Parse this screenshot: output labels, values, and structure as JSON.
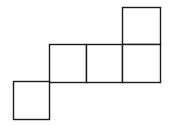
{
  "diagram": {
    "type": "square-net",
    "stroke_color": "#1a1a1a",
    "background": "#ffffff",
    "grid_cells": [
      {
        "id": "top-right",
        "col": 3,
        "row": 0
      },
      {
        "id": "middle-left",
        "col": 1,
        "row": 1
      },
      {
        "id": "middle-center",
        "col": 2,
        "row": 1
      },
      {
        "id": "middle-right",
        "col": 3,
        "row": 1
      },
      {
        "id": "bottom-left",
        "col": 0,
        "row": 2
      }
    ]
  }
}
